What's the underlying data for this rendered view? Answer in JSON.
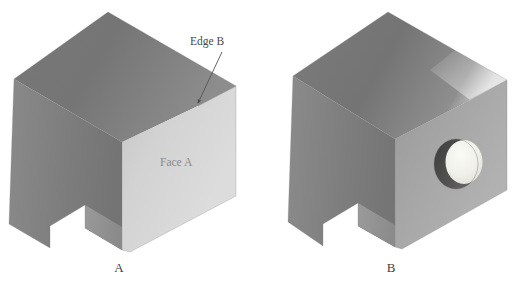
{
  "figure": {
    "kind": "technical-illustration",
    "background_color": "#ffffff",
    "panels": [
      {
        "id": "panel-a",
        "caption": "A",
        "caption_pos": {
          "x": 119,
          "y": 272
        },
        "annotations": [
          {
            "name": "face-a-label",
            "text": "Face A",
            "x": 160,
            "y": 166
          },
          {
            "name": "edge-b-label",
            "text": "Edge B",
            "x": 190,
            "y": 45
          }
        ]
      },
      {
        "id": "panel-b",
        "caption": "B",
        "caption_pos": {
          "x": 391,
          "y": 272
        },
        "annotations": []
      }
    ]
  },
  "colors": {
    "background": "#ffffff",
    "top_face_dark": "#6b6b6b",
    "top_face_light": "#9c9c9c",
    "left_face_dark": "#707070",
    "left_face_light": "#868686",
    "front_face_light": "#c9c9c9",
    "front_face_pale": "#d8d8d8",
    "front_face_mid": "#a0a0a0",
    "notch_face": "#8f8f8f",
    "bore_shadow": "#4a4a4a",
    "bore_highlight": "#eeeeea",
    "edge_stroke": "#7f7f7f",
    "label_text": "#4a4a4a",
    "caption_text": "#3d3d3d",
    "leader_stroke": "#555555"
  },
  "geometry": {
    "note": "Two isometric views of the same notched block; view B has a through-hole bored in Face A."
  }
}
